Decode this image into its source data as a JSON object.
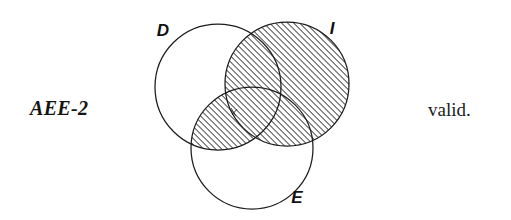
{
  "figure": {
    "background_color": "#ffffff",
    "ink_color": "#1b1b1b",
    "width": 511,
    "height": 220
  },
  "annotations": {
    "syllogism_code": "AEE-2",
    "validity": "valid."
  },
  "chart_data": {
    "type": "diagram",
    "subtype": "venn-three-set",
    "title": "AEE-2",
    "caption": "valid.",
    "sets": [
      {
        "id": "D",
        "label": "D",
        "cx": 218,
        "cy": 87,
        "r": 63,
        "label_x": 163,
        "label_y": 36,
        "shaded": false
      },
      {
        "id": "I",
        "label": "I",
        "cx": 287,
        "cy": 84,
        "r": 62,
        "label_x": 332,
        "label_y": 34,
        "shaded": true
      },
      {
        "id": "E",
        "label": "E",
        "cx": 252,
        "cy": 148,
        "r": 61,
        "label_x": 297,
        "label_y": 203,
        "shaded": false
      }
    ],
    "shaded_regions": [
      {
        "id": "I-full",
        "description": "entire I circle",
        "members": [
          "I"
        ]
      },
      {
        "id": "D-and-E",
        "description": "intersection of D and E",
        "members": [
          "D",
          "E"
        ]
      }
    ],
    "hatch": {
      "style": "diagonal-lines",
      "direction": "lower-left-to-upper-right",
      "angle_deg": 45,
      "spacing_px": 3,
      "line_width_px": 1,
      "color": "#1b1b1b"
    },
    "marks": [
      {
        "id": "center-artifact",
        "x": 234,
        "y": 112,
        "type": "small-x"
      }
    ]
  }
}
